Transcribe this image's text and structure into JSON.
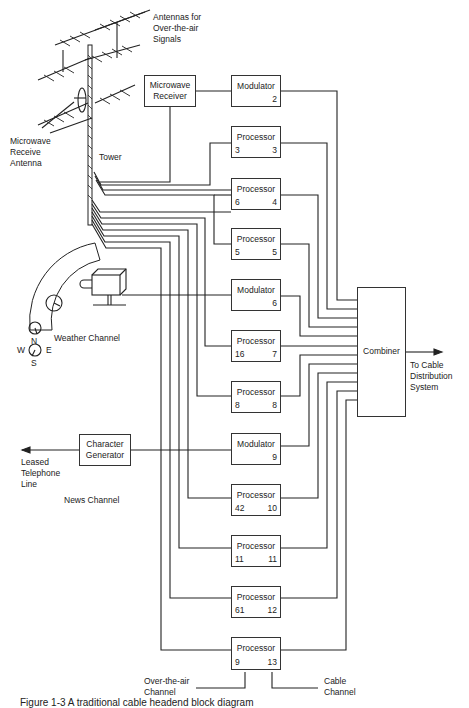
{
  "diagram": {
    "labels": {
      "antennas": [
        "Antennas for",
        "Over-the-air",
        "Signals"
      ],
      "microwave_antenna": [
        "Microwave",
        "Receive",
        "Antenna"
      ],
      "tower": "Tower",
      "weather_channel": "Weather Channel",
      "news_channel": "News Channel",
      "leased_line": [
        "Leased",
        "Telephone",
        "Line"
      ],
      "to_cable": [
        "To Cable",
        "Distribution",
        "System"
      ],
      "over_the_air_channel": [
        "Over-the-air",
        "Channel"
      ],
      "cable_channel": [
        "Cable",
        "Channel"
      ],
      "compass": {
        "n": "N",
        "s": "S",
        "e": "E",
        "w": "W"
      }
    },
    "sources": {
      "microwave_receiver": [
        "Microwave",
        "Receiver"
      ],
      "character_generator": [
        "Character",
        "Generator"
      ]
    },
    "combiner": "Combiner",
    "units": [
      {
        "type": "Modulator",
        "input": "",
        "output": "2"
      },
      {
        "type": "Processor",
        "input": "3",
        "output": "3"
      },
      {
        "type": "Processor",
        "input": "6",
        "output": "4"
      },
      {
        "type": "Processor",
        "input": "5",
        "output": "5"
      },
      {
        "type": "Modulator",
        "input": "",
        "output": "6"
      },
      {
        "type": "Processor",
        "input": "16",
        "output": "7"
      },
      {
        "type": "Processor",
        "input": "8",
        "output": "8"
      },
      {
        "type": "Modulator",
        "input": "",
        "output": "9"
      },
      {
        "type": "Processor",
        "input": "42",
        "output": "10"
      },
      {
        "type": "Processor",
        "input": "11",
        "output": "11"
      },
      {
        "type": "Processor",
        "input": "61",
        "output": "12"
      },
      {
        "type": "Processor",
        "input": "9",
        "output": "13"
      }
    ],
    "caption": "Figure 1-3  A traditional cable headend block diagram"
  }
}
